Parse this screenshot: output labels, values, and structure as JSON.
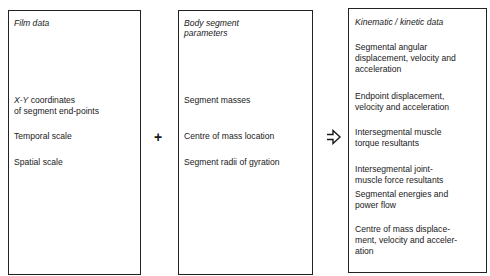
{
  "boxes": [
    {
      "title": "Film data",
      "items": [
        "X-Y coordinates",
        "of segment end-points",
        "Temporal scale",
        "Spatial scale"
      ]
    },
    {
      "title_line1": "Body segment",
      "title_line2": "parameters",
      "items": [
        "Segment masses",
        "Centre of mass location",
        "Segment radii of gyration"
      ]
    },
    {
      "title": "Kinematic / kinetic data",
      "items": [
        [
          "Segmental angular",
          "displacement, velocity and",
          "acceleration"
        ],
        [
          "Endpoint displacement,",
          "velocity and acceleration"
        ],
        [
          "Intersegmental muscle",
          "torque resultants"
        ],
        [
          "Intersegmental joint-",
          "muscle force resultants"
        ],
        [
          "Segmental energies and",
          "power flow"
        ],
        [
          "Centre of mass displace-",
          "ment, velocity and acceler-",
          "ation"
        ]
      ]
    }
  ],
  "operators": {
    "plus": "+",
    "arrow_icon": "hollow-right-arrow"
  },
  "xy_prefix": "X-Y",
  "xy_suffix": " coordinates"
}
